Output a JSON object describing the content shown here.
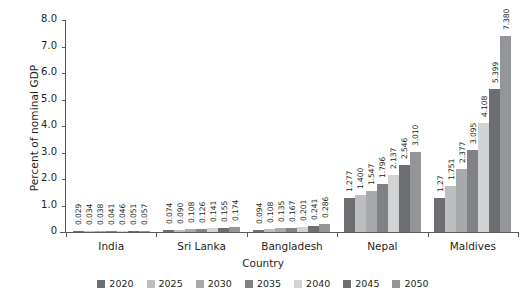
{
  "chart_data": {
    "type": "bar",
    "title": "",
    "xlabel": "Country",
    "ylabel": "Percent of nominal GDP",
    "ylim": [
      0,
      8.0
    ],
    "yticks": [
      "0",
      "1.0",
      "2.0",
      "3.0",
      "4.0",
      "5.0",
      "6.0",
      "7.0",
      "8.0"
    ],
    "ytick_values": [
      0,
      1,
      2,
      3,
      4,
      5,
      6,
      7,
      8
    ],
    "grid": false,
    "legend_position": "bottom",
    "categories": [
      "India",
      "Sri Lanka",
      "Bangladesh",
      "Nepal",
      "Maldives"
    ],
    "series": [
      {
        "name": "2020",
        "color": "#6d6e71",
        "values": [
          0.029,
          0.074,
          0.094,
          1.277,
          1.27
        ],
        "labels": [
          "0.029",
          "0.074",
          "0.094",
          "1.277",
          "1.27"
        ]
      },
      {
        "name": "2025",
        "color": "#bcbec0",
        "values": [
          0.034,
          0.09,
          0.108,
          1.4,
          1.751
        ],
        "labels": [
          "0.034",
          "0.090",
          "0.108",
          "1.400",
          "1.751"
        ]
      },
      {
        "name": "2030",
        "color": "#a7a9ac",
        "values": [
          0.038,
          0.108,
          0.135,
          1.547,
          2.377
        ],
        "labels": [
          "0.038",
          "0.108",
          "0.135",
          "1.547",
          "2.377"
        ]
      },
      {
        "name": "2035",
        "color": "#808285",
        "values": [
          0.041,
          0.126,
          0.167,
          1.796,
          3.095
        ],
        "labels": [
          "0.041",
          "0.126",
          "0.167",
          "1.796",
          "3.095"
        ]
      },
      {
        "name": "2040",
        "color": "#d1d3d4",
        "values": [
          0.046,
          0.141,
          0.201,
          2.137,
          4.108
        ],
        "labels": [
          "0.046",
          "0.141",
          "0.201",
          "2.137",
          "4.108"
        ]
      },
      {
        "name": "2045",
        "color": "#6d6e71",
        "values": [
          0.051,
          0.155,
          0.241,
          2.546,
          5.399
        ],
        "labels": [
          "0.051",
          "0.155",
          "0.241",
          "2.546",
          "5.399"
        ]
      },
      {
        "name": "2050",
        "color": "#939598",
        "values": [
          0.057,
          0.174,
          0.286,
          3.01,
          7.38
        ],
        "labels": [
          "0.057",
          "0.174",
          "0.286",
          "3.010",
          "7.380"
        ]
      }
    ]
  },
  "axis": {
    "y_title": "Percent of nominal GDP",
    "x_title": "Country"
  }
}
